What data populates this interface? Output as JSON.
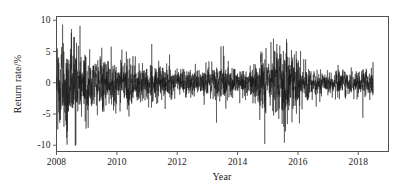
{
  "chart_data": {
    "type": "line",
    "title": "",
    "subtitle": "",
    "xlabel": "Year",
    "ylabel": "Return rate/%",
    "xlim": [
      2008.0,
      2019.0
    ],
    "ylim": [
      -11.0,
      10.6
    ],
    "xticks": [
      2008,
      2010,
      2012,
      2014,
      2016,
      2018
    ],
    "xtick_labels": [
      "2008",
      "2010",
      "2012",
      "2014",
      "2016",
      "2018"
    ],
    "yticks": [
      10,
      5,
      0,
      -5,
      -10
    ],
    "ytick_labels": [
      "10",
      "5",
      "0",
      "-5",
      "-10"
    ],
    "grid": false,
    "legend": null,
    "legend_position": "none",
    "series": [
      {
        "name": "Return rate",
        "color": "#111111",
        "line_width": 0.5,
        "x_start": 2008.0,
        "x_end": 2018.5,
        "n_points": 2550,
        "description": "Daily stock index log-return series in percent; volatility clustering with extreme swings near 2008-2009 and 2015, calm periods 2012-2013 and 2017-2018.",
        "summary_stats": {
          "mean": 0.02,
          "min": -10.2,
          "max": 9.6,
          "std_overall": 1.85
        },
        "volatility_envelope": [
          {
            "year": 2008.0,
            "sigma": 3.2
          },
          {
            "year": 2008.25,
            "sigma": 3.6
          },
          {
            "year": 2008.5,
            "sigma": 3.3
          },
          {
            "year": 2008.75,
            "sigma": 3.5
          },
          {
            "year": 2009.0,
            "sigma": 2.6
          },
          {
            "year": 2009.3,
            "sigma": 2.3
          },
          {
            "year": 2009.6,
            "sigma": 2.2
          },
          {
            "year": 2010.0,
            "sigma": 1.8
          },
          {
            "year": 2010.5,
            "sigma": 1.7
          },
          {
            "year": 2011.0,
            "sigma": 1.6
          },
          {
            "year": 2011.5,
            "sigma": 1.5
          },
          {
            "year": 2012.0,
            "sigma": 1.2
          },
          {
            "year": 2012.5,
            "sigma": 1.1
          },
          {
            "year": 2013.0,
            "sigma": 1.3
          },
          {
            "year": 2013.4,
            "sigma": 1.7
          },
          {
            "year": 2013.8,
            "sigma": 1.3
          },
          {
            "year": 2014.2,
            "sigma": 1.2
          },
          {
            "year": 2014.6,
            "sigma": 1.5
          },
          {
            "year": 2014.85,
            "sigma": 2.6
          },
          {
            "year": 2015.1,
            "sigma": 2.4
          },
          {
            "year": 2015.4,
            "sigma": 3.2
          },
          {
            "year": 2015.6,
            "sigma": 3.4
          },
          {
            "year": 2015.9,
            "sigma": 2.4
          },
          {
            "year": 2016.1,
            "sigma": 2.0
          },
          {
            "year": 2016.4,
            "sigma": 1.2
          },
          {
            "year": 2016.8,
            "sigma": 0.9
          },
          {
            "year": 2017.2,
            "sigma": 0.9
          },
          {
            "year": 2017.6,
            "sigma": 1.1
          },
          {
            "year": 2018.0,
            "sigma": 1.3
          },
          {
            "year": 2018.2,
            "sigma": 1.4
          },
          {
            "year": 2018.5,
            "sigma": 1.2
          }
        ],
        "notable_spikes": [
          {
            "year": 2008.2,
            "value": 9.3
          },
          {
            "year": 2008.35,
            "value": -9.9
          },
          {
            "year": 2008.5,
            "value": 8.6
          },
          {
            "year": 2008.62,
            "value": -10.1
          },
          {
            "year": 2008.78,
            "value": 9.1
          },
          {
            "year": 2009.05,
            "value": -7.2
          },
          {
            "year": 2009.5,
            "value": 5.6
          },
          {
            "year": 2010.4,
            "value": -5.4
          },
          {
            "year": 2011.6,
            "value": -4.2
          },
          {
            "year": 2013.3,
            "value": -6.4
          },
          {
            "year": 2013.45,
            "value": 5.8
          },
          {
            "year": 2014.9,
            "value": -9.8
          },
          {
            "year": 2015.3,
            "value": 6.2
          },
          {
            "year": 2015.55,
            "value": -9.6
          },
          {
            "year": 2015.62,
            "value": 7.0
          },
          {
            "year": 2016.05,
            "value": -6.5
          },
          {
            "year": 2018.15,
            "value": -5.6
          }
        ]
      }
    ],
    "axes_style": {
      "frame": "box",
      "frame_color": "#4f4f4f",
      "tick_direction": "out",
      "background": "#ffffff"
    }
  },
  "axis": {
    "x_title": "Year",
    "y_title": "Return rate/%",
    "xtick_labels": [
      "2008",
      "2010",
      "2012",
      "2014",
      "2016",
      "2018"
    ],
    "ytick_labels": [
      "10",
      "5",
      "0",
      "-5",
      "-10"
    ]
  }
}
